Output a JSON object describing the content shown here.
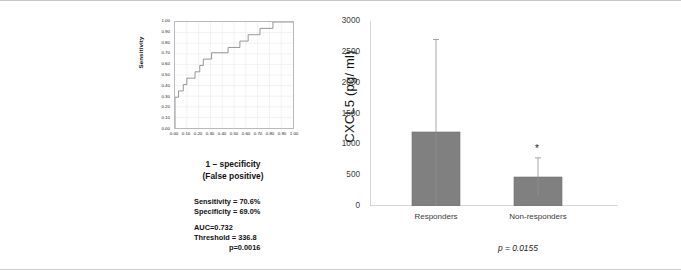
{
  "figure": {
    "panel_a_letter": "A",
    "panel_b_letter": "B"
  },
  "panel_a": {
    "y_axis_title": "Sensitivity",
    "x_axis_title_line1": "1 – specificity",
    "x_axis_title_line2": "(False positive)",
    "stats": {
      "sensitivity": "Sensitivity = 70.6%",
      "specificity": "Specificity = 69.0%",
      "auc": "AUC=0.732",
      "threshold": "Threshold = 336.8",
      "pvalue": "p=0.0016"
    }
  },
  "panel_b": {
    "y_axis_title": "CXCL5 (pg/ ml)",
    "significance_marker": "*",
    "pvalue": "p = 0.0155"
  },
  "chart_data": [
    {
      "type": "line",
      "name": "roc-curve",
      "title": "",
      "xlabel": "1 – specificity (False positive)",
      "ylabel": "Sensitivity",
      "xlim": [
        0,
        1
      ],
      "ylim": [
        0,
        1
      ],
      "grid": true,
      "xticks": [
        "0.00",
        "0.10",
        "0.20",
        "0.30",
        "0.40",
        "0.50",
        "0.60",
        "0.70",
        "0.80",
        "0.90",
        "1.00"
      ],
      "yticks": [
        "0.00",
        "0.10",
        "0.20",
        "0.30",
        "0.40",
        "0.50",
        "0.60",
        "0.70",
        "0.80",
        "0.90",
        "1.00"
      ],
      "x": [
        0.0,
        0.0,
        0.03,
        0.03,
        0.07,
        0.07,
        0.1,
        0.1,
        0.17,
        0.17,
        0.21,
        0.21,
        0.24,
        0.24,
        0.31,
        0.31,
        0.38,
        0.38,
        0.45,
        0.45,
        0.55,
        0.55,
        0.62,
        0.62,
        0.72,
        0.72,
        0.83,
        0.83,
        1.0
      ],
      "y": [
        0.0,
        0.29,
        0.29,
        0.35,
        0.35,
        0.41,
        0.41,
        0.47,
        0.47,
        0.53,
        0.53,
        0.59,
        0.59,
        0.65,
        0.65,
        0.71,
        0.71,
        0.71,
        0.71,
        0.76,
        0.76,
        0.82,
        0.82,
        0.88,
        0.88,
        0.94,
        0.94,
        1.0,
        1.0
      ],
      "annotations": [
        "Sensitivity = 70.6%",
        "Specificity = 69.0%",
        "AUC=0.732",
        "Threshold = 336.8",
        "p=0.0016"
      ]
    },
    {
      "type": "bar",
      "name": "cxcl5-bar-chart",
      "title": "",
      "xlabel": "",
      "ylabel": "CXCL5 (pg/ ml)",
      "ylim": [
        0,
        3000
      ],
      "yticks": [
        0,
        500,
        1000,
        1500,
        2000,
        2500,
        3000
      ],
      "grid": false,
      "categories": [
        "Responders",
        "Non-responders"
      ],
      "values": [
        1200,
        470
      ],
      "errors_upper": [
        2700,
        780
      ],
      "errors_lower": [
        0,
        170
      ],
      "bar_color": "#808080",
      "annotations": [
        "*",
        "p = 0.0155"
      ]
    }
  ]
}
